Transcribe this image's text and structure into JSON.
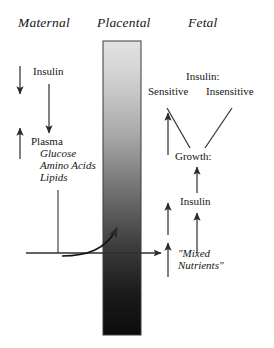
{
  "diagram": {
    "title_row": {
      "maternal": "Maternal",
      "placental": "Placental",
      "fetal": "Fetal"
    },
    "maternal": {
      "insulin": "Insulin",
      "plasma": "Plasma",
      "glucose": "Glucose",
      "amino_acids": "Amino Acids",
      "lipids": "Lipids"
    },
    "placental": {
      "gradient_top_color": "#dcdcdc",
      "gradient_bottom_color": "#0d0d0d",
      "border_color": "#3a3a3a"
    },
    "fetal": {
      "insulin_header": "Insulin:",
      "sensitive": "Sensitive",
      "insensitive": "Insensitive",
      "growth": "Growth:",
      "insulin": "Insulin",
      "mixed_nutrients_line1": "\"Mixed",
      "mixed_nutrients_line2": "Nutrients\""
    },
    "arrows": {
      "maternal_insulin_down": "down-arrow",
      "maternal_plasma_up": "up-arrow",
      "maternal_insulin_to_plasma_down": "down-arrow",
      "plasma_to_placenta_line": "connector-line",
      "transfer_horizontal": "right-arrow",
      "placental_uptake_curve": "curved-up-arrow",
      "fetal_nutrients_up_lower": "up-arrow",
      "fetal_nutrients_up_upper": "up-arrow",
      "fetal_insulin_up": "up-arrow",
      "fetal_growth_up": "up-arrow",
      "growth_to_sensitive": "diagonal-line",
      "growth_to_insensitive": "diagonal-line",
      "sensitive_up": "up-arrow"
    }
  }
}
